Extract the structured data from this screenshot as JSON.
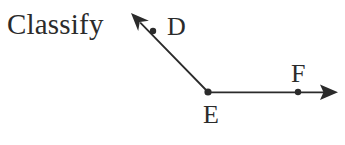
{
  "figure": {
    "prompt_text": "Classify",
    "background_color": "#ffffff",
    "ink_color": "#2b2b2b",
    "labels": {
      "d": "D",
      "e": "E",
      "f": "F"
    },
    "vertex_label": "E",
    "ray_labels": [
      "D",
      "F"
    ]
  },
  "chart_data": {
    "type": "diagram",
    "title": "Classify",
    "points": [
      {
        "name": "D",
        "x": 153,
        "y": 31,
        "label_x": 167,
        "label_y": 14,
        "dot_radius": 3.2
      },
      {
        "name": "E",
        "x": 208,
        "y": 92,
        "label_x": 203,
        "label_y": 102,
        "dot_radius": 3.6
      },
      {
        "name": "F",
        "x": 298,
        "y": 92,
        "label_x": 291,
        "label_y": 61,
        "dot_radius": 3.2
      }
    ],
    "rays": [
      {
        "name": "ray-ED",
        "from": "E",
        "through": "D",
        "start": [
          208,
          92
        ],
        "end": [
          131,
          13
        ],
        "arrow_at_end": true,
        "passes_through_point": "D"
      },
      {
        "name": "ray-EF",
        "from": "E",
        "through": "F",
        "start": [
          208,
          92
        ],
        "end": [
          338,
          92
        ],
        "arrow_at_end": true,
        "passes_through_point": "F"
      }
    ],
    "angle": {
      "vertex": "E",
      "arms": [
        "D",
        "F"
      ],
      "approx_degrees": 134
    },
    "stroke_width": 1.8,
    "stroke_color": "#2b2b2b"
  }
}
